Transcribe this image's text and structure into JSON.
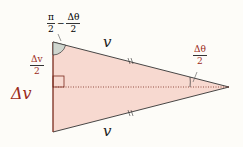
{
  "diagram": {
    "type": "isosceles-triangle-velocity-change",
    "colors": {
      "fill": "#f7d9d0",
      "edge": "#7a2a1c",
      "angle_fill": "#cfd6cf",
      "text": "#222222",
      "red_text": "#9b2a1a"
    },
    "labels": {
      "top_side": "v",
      "bottom_side": "v",
      "left_side": "Δv",
      "half_left": {
        "num": "Δv",
        "den": "2"
      },
      "top_angle": {
        "a_num": "π",
        "a_den": "2",
        "minus": "−",
        "b_num": "Δθ",
        "b_den": "2"
      },
      "apex_angle": {
        "num": "Δθ",
        "den": "2"
      }
    }
  }
}
